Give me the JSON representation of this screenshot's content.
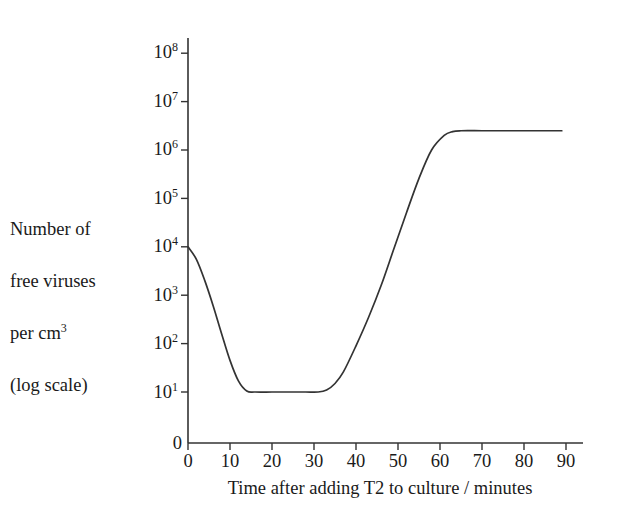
{
  "chart_data": {
    "type": "line",
    "title": "",
    "xlabel": "Time after adding T2 to culture / minutes",
    "ylabel_lines": [
      "Number of",
      "free viruses",
      "per cm",
      "(log scale)"
    ],
    "ylabel_superscript": "3",
    "ylabel_full": "Number of free viruses per cm3 (log scale)",
    "y_scale": "log",
    "xlim": [
      0,
      90
    ],
    "ylim": [
      10,
      100000000
    ],
    "grid": false,
    "legend": false,
    "x_ticks": [
      0,
      10,
      20,
      30,
      40,
      50,
      60,
      70,
      80,
      90
    ],
    "x_tick_labels": [
      "0",
      "10",
      "20",
      "30",
      "40",
      "50",
      "60",
      "70",
      "80",
      "90"
    ],
    "y_ticks": [
      10,
      100,
      1000,
      10000,
      100000,
      1000000,
      10000000,
      100000000
    ],
    "y_tick_labels": [
      "10",
      "10",
      "10",
      "10",
      "10",
      "10",
      "10",
      "10"
    ],
    "y_tick_exponents": [
      "1",
      "2",
      "3",
      "4",
      "5",
      "6",
      "7",
      "8"
    ],
    "y_origin_label": "0",
    "series": [
      {
        "name": "Free virus concentration",
        "x": [
          0,
          2,
          4,
          6,
          8,
          10,
          12,
          14,
          16,
          20,
          24,
          28,
          31,
          33,
          35,
          37,
          40,
          43,
          46,
          49,
          52,
          55,
          58,
          61,
          63,
          65,
          70,
          75,
          80,
          85,
          89
        ],
        "values": [
          10000,
          5500,
          2000,
          600,
          160,
          45,
          17,
          10.5,
          10,
          10,
          10,
          10,
          10,
          11,
          15,
          26,
          90,
          350,
          1600,
          9000,
          50000,
          260000,
          1000000,
          2000000,
          2400000,
          2500000,
          2500000,
          2500000,
          2500000,
          2500000,
          2500000
        ]
      }
    ],
    "annotations": {
      "initial_value": 10000,
      "eclipse_minimum": 10,
      "eclipse_start_minutes": 14,
      "eclipse_end_minutes": 31,
      "plateau_value": 2500000,
      "plateau_start_minutes": 63
    },
    "colors": {
      "line": "#333333",
      "axis": "#333333",
      "background": "#ffffff",
      "text": "#1a1a1a"
    }
  }
}
